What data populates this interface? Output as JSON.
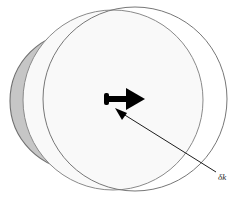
{
  "figure": {
    "background_color": "#ffffff",
    "width": 245,
    "height": 204,
    "annotation": {
      "label": "δk",
      "label_name": "delta-k-label",
      "label_x": 219,
      "label_y": 177,
      "leader_line": {
        "from_x": 216,
        "from_y": 172,
        "to_x": 117,
        "to_y": 110,
        "color": "#1d1d1d",
        "width": 1
      }
    },
    "arrow": {
      "name": "displacement-arrow",
      "color": "#000000",
      "tail_x": 106,
      "tail_y": 99,
      "tip_x": 143,
      "tip_y": 99,
      "shaft_thickness": 6,
      "head_length": 18,
      "head_half_width": 12,
      "tail_bulb_width": 5,
      "tail_bulb_height": 12
    },
    "circles": [
      {
        "name": "left-shaded-sphere",
        "cx": 79,
        "cy": 101,
        "r": 69,
        "fill": "#c6c6c6",
        "stroke": "#6f6f6f",
        "stroke_width": 1.1,
        "order": 1
      },
      {
        "name": "middle-sphere",
        "cx": 113,
        "cy": 100,
        "r": 90,
        "fill": "#f9f9f9",
        "stroke": "#8a8a8a",
        "stroke_width": 1.0,
        "order": 2
      },
      {
        "name": "right-outline-sphere",
        "cx": 135,
        "cy": 99,
        "r": 92,
        "fill": "#ffffff",
        "stroke": "#777777",
        "stroke_width": 1.0,
        "order": 3
      }
    ],
    "colors": {
      "shaded_fill": "#c6c6c6",
      "mid_fill": "#f9f9f9",
      "white_fill": "#ffffff",
      "outline": "#7a7a7a",
      "ink": "#000000"
    }
  }
}
